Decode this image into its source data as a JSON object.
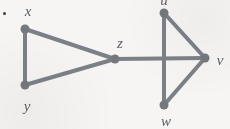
{
  "figure": {
    "background_color": "#f6f5f3",
    "edge_color": "#7c8187",
    "vertex_color": "#75797e",
    "label_color": "#5d6166",
    "width": 230,
    "height": 129
  },
  "bullet": {
    "name": "item-bullet",
    "x": 3,
    "y": 12,
    "color": "#3b3d40"
  },
  "graph_data": {
    "type": "graph",
    "description": "Undirected graph with two triangles joined at vertex z; the z-v edge crosses the u-w edge without a vertex at the crossing.",
    "vertex_count": 6,
    "edge_count": 7,
    "vertices": [
      {
        "id": "x",
        "label": "x",
        "cx": 25,
        "cy": 29,
        "r": 4.5,
        "label_x": 28,
        "label_y": 11
      },
      {
        "id": "y",
        "label": "y",
        "cx": 25,
        "cy": 85,
        "r": 4.5,
        "label_x": 27,
        "label_y": 106
      },
      {
        "id": "z",
        "label": "z",
        "cx": 115,
        "cy": 59,
        "r": 4.5,
        "label_x": 120,
        "label_y": 43
      },
      {
        "id": "u",
        "label": "u",
        "cx": 164,
        "cy": 13,
        "r": 4.5,
        "label_x": 164,
        "label_y": 0
      },
      {
        "id": "v",
        "label": "v",
        "cx": 205,
        "cy": 58,
        "r": 4.5,
        "label_x": 220,
        "label_y": 60
      },
      {
        "id": "w",
        "label": "w",
        "cx": 164,
        "cy": 105,
        "r": 4.5,
        "label_x": 166,
        "label_y": 121
      }
    ],
    "edges": [
      {
        "from": "x",
        "to": "y"
      },
      {
        "from": "x",
        "to": "z"
      },
      {
        "from": "y",
        "to": "z"
      },
      {
        "from": "z",
        "to": "v"
      },
      {
        "from": "u",
        "to": "w"
      },
      {
        "from": "u",
        "to": "v"
      },
      {
        "from": "w",
        "to": "v"
      }
    ],
    "edge_width": 4
  }
}
